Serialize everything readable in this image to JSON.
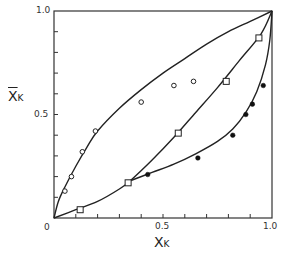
{
  "chart_data": {
    "type": "scatter",
    "title": "",
    "xlabel": "X_K",
    "ylabel": "X̄_K",
    "xlim": [
      0,
      1.0
    ],
    "ylim": [
      0,
      1.0
    ],
    "grid": false,
    "legend": null,
    "x_ticks": [
      "0",
      "0.5",
      "1.0"
    ],
    "y_ticks": [
      "0.5",
      "1.0"
    ],
    "series": [
      {
        "name": "open circles",
        "marker": "open-circle",
        "points": [
          [
            0.05,
            0.13
          ],
          [
            0.08,
            0.2
          ],
          [
            0.13,
            0.32
          ],
          [
            0.19,
            0.42
          ],
          [
            0.4,
            0.56
          ],
          [
            0.55,
            0.64
          ],
          [
            0.64,
            0.66
          ]
        ],
        "curve": [
          [
            0,
            0
          ],
          [
            0.02,
            0.08
          ],
          [
            0.05,
            0.15
          ],
          [
            0.1,
            0.25
          ],
          [
            0.15,
            0.34
          ],
          [
            0.2,
            0.42
          ],
          [
            0.3,
            0.53
          ],
          [
            0.4,
            0.62
          ],
          [
            0.5,
            0.7
          ],
          [
            0.6,
            0.77
          ],
          [
            0.7,
            0.84
          ],
          [
            0.8,
            0.9
          ],
          [
            0.9,
            0.95
          ],
          [
            1.0,
            1.0
          ]
        ]
      },
      {
        "name": "open squares",
        "marker": "open-square",
        "points": [
          [
            0.12,
            0.04
          ],
          [
            0.34,
            0.17
          ],
          [
            0.57,
            0.41
          ],
          [
            0.79,
            0.66
          ],
          [
            0.94,
            0.87
          ]
        ],
        "curve": [
          [
            0,
            0
          ],
          [
            0.1,
            0.04
          ],
          [
            0.2,
            0.08
          ],
          [
            0.3,
            0.14
          ],
          [
            0.35,
            0.18
          ],
          [
            0.45,
            0.28
          ],
          [
            0.55,
            0.39
          ],
          [
            0.65,
            0.51
          ],
          [
            0.75,
            0.63
          ],
          [
            0.85,
            0.76
          ],
          [
            0.95,
            0.89
          ],
          [
            1.0,
            1.0
          ]
        ]
      },
      {
        "name": "filled circles",
        "marker": "filled-circle",
        "points": [
          [
            0.43,
            0.21
          ],
          [
            0.66,
            0.29
          ],
          [
            0.82,
            0.4
          ],
          [
            0.88,
            0.5
          ],
          [
            0.91,
            0.55
          ],
          [
            0.96,
            0.64
          ]
        ],
        "curve": [
          [
            0.35,
            0.18
          ],
          [
            0.45,
            0.22
          ],
          [
            0.55,
            0.26
          ],
          [
            0.65,
            0.31
          ],
          [
            0.75,
            0.37
          ],
          [
            0.82,
            0.43
          ],
          [
            0.88,
            0.51
          ],
          [
            0.93,
            0.61
          ],
          [
            0.97,
            0.74
          ],
          [
            0.99,
            0.86
          ],
          [
            1.0,
            1.0
          ]
        ]
      }
    ]
  },
  "labels": {
    "y_axis": "X",
    "y_axis_sub": "K",
    "x_axis": "X",
    "x_axis_sub": "K",
    "y_tick_top": "1.0",
    "y_tick_mid": "0.5",
    "x_tick_zero": "0",
    "x_tick_mid": "0.5",
    "x_tick_end": "1.0"
  }
}
